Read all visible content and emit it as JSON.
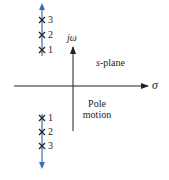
{
  "diagram": {
    "title": "s-plane pole motion",
    "axes": {
      "vertical_label": "jω",
      "horizontal_label": "σ",
      "plane_label_prefix": "s",
      "plane_label_suffix": "-plane"
    },
    "annotation": {
      "line1": "Pole",
      "line2": "motion"
    },
    "upper_poles": [
      {
        "label": "3",
        "y": 20
      },
      {
        "label": "2",
        "y": 35
      },
      {
        "label": "1",
        "y": 50
      }
    ],
    "lower_poles": [
      {
        "label": "1",
        "y": 118
      },
      {
        "label": "2",
        "y": 132
      },
      {
        "label": "3",
        "y": 146
      }
    ],
    "colors": {
      "axis": "#222222",
      "motion_arrow": "#3a6fb5",
      "pole_marker": "#222222"
    }
  }
}
